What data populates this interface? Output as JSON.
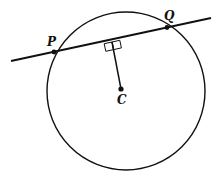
{
  "diagram": {
    "type": "geometry",
    "colors": {
      "stroke": "#111111",
      "background": "#ffffff"
    },
    "labels": {
      "P": "P",
      "Q": "Q",
      "C": "C"
    },
    "points": {
      "P": {
        "x": 54,
        "y": 51
      },
      "Q": {
        "x": 167,
        "y": 27
      },
      "C": {
        "x": 121,
        "y": 89
      },
      "foot": {
        "x": 112,
        "y": 41
      }
    },
    "circle": {
      "cx": 126,
      "cy": 91,
      "r": 80
    },
    "line": {
      "x1": 11,
      "y1": 61,
      "x2": 211,
      "y2": 18
    },
    "right_angle_marks": 2
  }
}
